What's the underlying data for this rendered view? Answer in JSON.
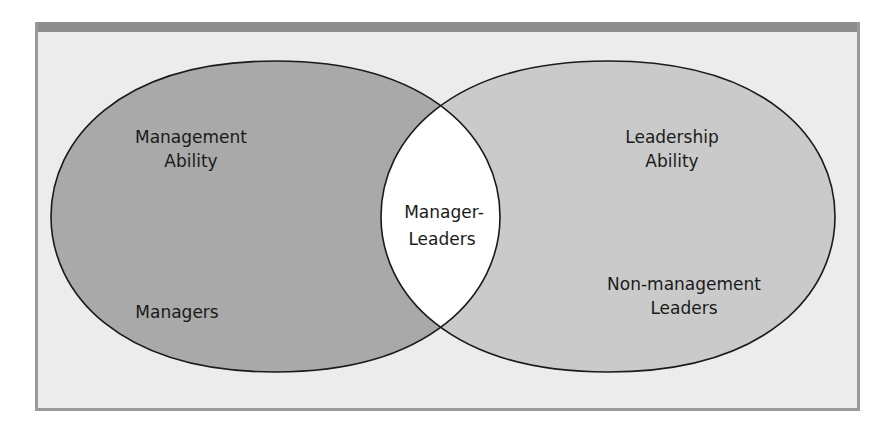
{
  "diagram": {
    "type": "venn",
    "colors": {
      "frame_background": "#ececec",
      "frame_bar": "#8e8e8e",
      "frame_border": "#9a9a9a",
      "left_set_fill": "#a9a9a9",
      "right_set_fill": "#cacaca",
      "intersection_fill": "#ffffff",
      "outline": "#1a1a1a"
    },
    "left_set": {
      "title_lines": [
        "Management",
        "Ability"
      ],
      "exclusive_label": "Managers"
    },
    "right_set": {
      "title_lines": [
        "Leadership",
        "Ability"
      ],
      "exclusive_label_lines": [
        "Non-management",
        "Leaders"
      ]
    },
    "intersection": {
      "label_lines": [
        "Manager-",
        "Leaders"
      ]
    }
  }
}
